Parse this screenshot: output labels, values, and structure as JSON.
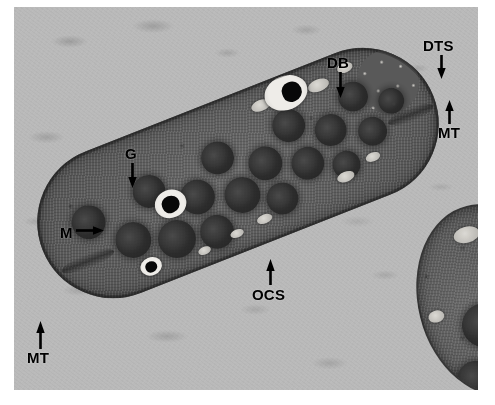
{
  "figure": {
    "type": "transmission-electron-micrograph",
    "background_color": "#b9b9b9",
    "plate_border_color": "#ffffff"
  },
  "labels": [
    {
      "id": "db",
      "text": "DB",
      "full_name": "dense body",
      "arrow": "down",
      "x": 327,
      "y": 55
    },
    {
      "id": "dts",
      "text": "DTS",
      "full_name": "dense tubular system",
      "arrow": "down",
      "x": 423,
      "y": 38
    },
    {
      "id": "mt_top",
      "text": "MT",
      "full_name": "microtubules",
      "arrow": "up",
      "x": 440,
      "y": 122
    },
    {
      "id": "g",
      "text": "G",
      "full_name": "granule",
      "arrow": "down",
      "x": 126,
      "y": 146
    },
    {
      "id": "m",
      "text": "M",
      "full_name": "mitochondrion",
      "arrow": "right",
      "x": 60,
      "y": 224
    },
    {
      "id": "ocs",
      "text": "OCS",
      "full_name": "open canalicular system",
      "arrow": "up",
      "x": 256,
      "y": 287
    },
    {
      "id": "mt_bottom",
      "text": "MT",
      "full_name": "microtubules",
      "arrow": "up",
      "x": 32,
      "y": 349
    }
  ],
  "structures": {
    "platelet_primary": "elongated discoid platelet oriented lower-left to upper-right",
    "platelet_secondary": "partial platelet at lower-right edge",
    "alpha_granules_count": 17,
    "dense_bodies_count": 3
  },
  "granules": [
    {
      "x": 36,
      "y": 50,
      "w": 34,
      "h": 34
    },
    {
      "x": 70,
      "y": 82,
      "w": 36,
      "h": 36
    },
    {
      "x": 104,
      "y": 44,
      "w": 33,
      "h": 33
    },
    {
      "x": 110,
      "y": 96,
      "w": 38,
      "h": 38
    },
    {
      "x": 146,
      "y": 66,
      "w": 35,
      "h": 35
    },
    {
      "x": 152,
      "y": 106,
      "w": 34,
      "h": 34
    },
    {
      "x": 180,
      "y": 38,
      "w": 33,
      "h": 33
    },
    {
      "x": 188,
      "y": 80,
      "w": 36,
      "h": 36
    },
    {
      "x": 222,
      "y": 60,
      "w": 34,
      "h": 34
    },
    {
      "x": 226,
      "y": 100,
      "w": 32,
      "h": 32
    },
    {
      "x": 258,
      "y": 34,
      "w": 33,
      "h": 33
    },
    {
      "x": 262,
      "y": 76,
      "w": 33,
      "h": 33
    },
    {
      "x": 296,
      "y": 54,
      "w": 32,
      "h": 32
    },
    {
      "x": 300,
      "y": 94,
      "w": 28,
      "h": 28
    },
    {
      "x": 330,
      "y": 32,
      "w": 30,
      "h": 30
    },
    {
      "x": 336,
      "y": 72,
      "w": 29,
      "h": 29
    },
    {
      "x": 366,
      "y": 52,
      "w": 26,
      "h": 26
    }
  ],
  "vesicles": [
    {
      "x": 246,
      "y": 16,
      "w": 20,
      "h": 11
    },
    {
      "x": 278,
      "y": 14,
      "w": 17,
      "h": 10
    },
    {
      "x": 306,
      "y": 18,
      "w": 22,
      "h": 12
    },
    {
      "x": 340,
      "y": 12,
      "w": 16,
      "h": 10
    },
    {
      "x": 300,
      "y": 114,
      "w": 18,
      "h": 10
    },
    {
      "x": 334,
      "y": 106,
      "w": 15,
      "h": 9
    },
    {
      "x": 210,
      "y": 124,
      "w": 16,
      "h": 9
    },
    {
      "x": 180,
      "y": 128,
      "w": 14,
      "h": 8
    },
    {
      "x": 144,
      "y": 132,
      "w": 13,
      "h": 8
    }
  ],
  "dense_bodies": [
    {
      "vac_x": 262,
      "vac_y": 2,
      "vac_w": 44,
      "vac_h": 34,
      "core_x": 280,
      "core_y": 10,
      "core_w": 20,
      "core_h": 20
    },
    {
      "vac_x": 120,
      "vac_y": 66,
      "vac_w": 32,
      "vac_h": 28,
      "core_x": 127,
      "core_y": 72,
      "core_w": 18,
      "core_h": 17
    },
    {
      "vac_x": 84,
      "vac_y": 122,
      "vac_w": 22,
      "vac_h": 18,
      "core_x": 89,
      "core_y": 126,
      "core_w": 12,
      "core_h": 11
    }
  ]
}
